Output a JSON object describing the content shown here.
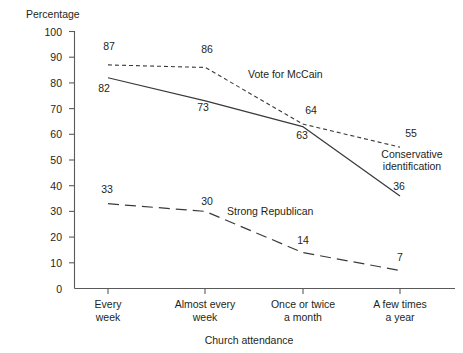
{
  "chart_data": {
    "type": "line",
    "title": "",
    "xlabel": "Church attendance",
    "ylabel": "Percentage",
    "ylim": [
      0,
      100
    ],
    "grid": false,
    "legend": "inline-annotations",
    "categories": [
      "Every week",
      "Almost every week",
      "Once or twice a month",
      "A few times a year"
    ],
    "category_lines": [
      [
        "Every",
        "week"
      ],
      [
        "Almost every",
        "week"
      ],
      [
        "Once or twice",
        "a month"
      ],
      [
        "A few times",
        "a year"
      ]
    ],
    "y_ticks": [
      0,
      10,
      20,
      30,
      40,
      50,
      60,
      70,
      80,
      90,
      100
    ],
    "series": [
      {
        "name": "Vote for McCain",
        "style": "dotted",
        "color": "#3a3a3a",
        "values": [
          87,
          86,
          64,
          55
        ]
      },
      {
        "name": "Conservative identification",
        "style": "solid",
        "color": "#3a3a3a",
        "values": [
          82,
          73,
          63,
          36
        ]
      },
      {
        "name": "Strong Republican",
        "style": "dashed",
        "color": "#3a3a3a",
        "values": [
          33,
          30,
          14,
          7
        ]
      }
    ],
    "annotations": [
      {
        "text": "Vote for McCain",
        "series": "Vote for McCain"
      },
      {
        "text": "Conservative",
        "series": "Conservative identification"
      },
      {
        "text": "identification",
        "series": "Conservative identification"
      },
      {
        "text": "Strong Republican",
        "series": "Strong Republican"
      }
    ]
  },
  "labels": {
    "y_axis_title": "Percentage",
    "x_axis_title": "Church attendance",
    "y_ticks": [
      "100",
      "90",
      "80",
      "70",
      "60",
      "50",
      "40",
      "30",
      "20",
      "10",
      "0"
    ],
    "x_ticks": [
      {
        "line1": "Every",
        "line2": "week"
      },
      {
        "line1": "Almost every",
        "line2": "week"
      },
      {
        "line1": "Once or twice",
        "line2": "a month"
      },
      {
        "line1": "A few times",
        "line2": "a year"
      }
    ],
    "mccain_values": [
      "87",
      "86",
      "64",
      "55"
    ],
    "conservative_values": [
      "82",
      "73",
      "63",
      "36"
    ],
    "republican_values": [
      "33",
      "30",
      "14",
      "7"
    ],
    "series_mccain": "Vote for McCain",
    "series_conservative_line1": "Conservative",
    "series_conservative_line2": "identification",
    "series_republican": "Strong Republican"
  }
}
